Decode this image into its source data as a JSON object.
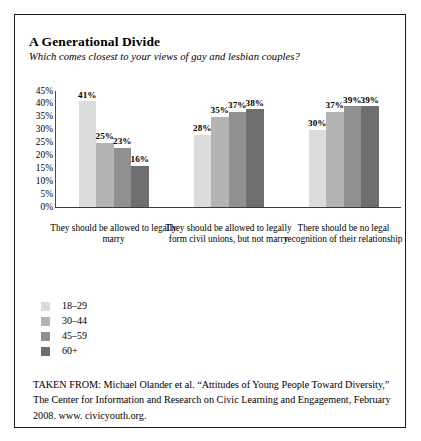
{
  "figure": {
    "title": "A Generational Divide",
    "question": "Which comes closest to your views of gay and lesbian couples?",
    "source_note": "TAKEN FROM: Michael Olander et al. “Attitudes of Young People Toward Diversity,” The Center for Information and Research on Civic Learning and Engagement, February 2008. www. civicyouth.org."
  },
  "chart_data": {
    "type": "bar",
    "title": "A Generational Divide",
    "subtitle": "Which comes closest to your views of gay and lesbian couples?",
    "xlabel": "",
    "ylabel": "",
    "ylim": [
      0,
      45
    ],
    "ytick_labels": [
      "45%",
      "40%",
      "35%",
      "30%",
      "25%",
      "20%",
      "15%",
      "10%",
      "5%",
      "0%"
    ],
    "ytick_values": [
      45,
      40,
      35,
      30,
      25,
      20,
      15,
      10,
      5,
      0
    ],
    "grid": false,
    "legend_position": "below-left",
    "value_suffix": "%",
    "categories": [
      "They should be allowed to legally marry",
      "They should be allowed to legally form civil unions, but not marry",
      "There should be no legal recognition of their relationship"
    ],
    "series": [
      {
        "name": "18–29",
        "color": "#dcdcdc",
        "values": [
          41,
          28,
          30
        ],
        "labels": [
          "41%",
          "28%",
          "30%"
        ]
      },
      {
        "name": "30–44",
        "color": "#b4b4b4",
        "values": [
          25,
          35,
          37
        ],
        "labels": [
          "25%",
          "35%",
          "37%"
        ]
      },
      {
        "name": "45–59",
        "color": "#909090",
        "values": [
          23,
          37,
          39
        ],
        "labels": [
          "23%",
          "37%",
          "39%"
        ]
      },
      {
        "name": "60+",
        "color": "#6e6e6e",
        "values": [
          16,
          38,
          39
        ],
        "labels": [
          "16%",
          "38%",
          "39%"
        ]
      }
    ]
  }
}
